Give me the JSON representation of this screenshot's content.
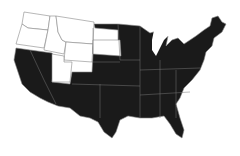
{
  "map": {
    "type": "choropleth",
    "region": "United States (contiguous)",
    "colors": {
      "highlighted": "#1a1a1a",
      "not_highlighted": "#ffffff",
      "border": "#888888"
    },
    "states_not_highlighted": [
      "Washington",
      "Oregon",
      "Idaho",
      "Montana",
      "Wyoming",
      "South Dakota",
      "Utah"
    ],
    "states_highlighted": "all other contiguous states"
  }
}
